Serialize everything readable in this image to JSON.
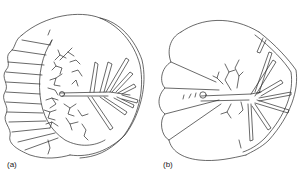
{
  "figure": {
    "panels": [
      {
        "id": "a",
        "label": "(a)"
      },
      {
        "id": "b",
        "label": "(b)"
      }
    ]
  },
  "colors": {
    "line": "#2a2a2a",
    "background": "#ffffff"
  }
}
